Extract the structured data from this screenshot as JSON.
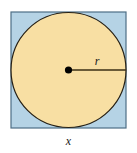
{
  "figure": {
    "kind": "geometry-diagram",
    "background_color": "#ffffff",
    "square": {
      "name": "outer-square",
      "fill_color": "#b5d3e5",
      "stroke_color": "#4e6f85",
      "stroke_width": 1.2,
      "x": 11,
      "y": 12,
      "width": 115,
      "height": 116,
      "side_label": "x"
    },
    "circle": {
      "name": "inscribed-circle",
      "fill_color": "#f8dfa3",
      "stroke_color": "#272014",
      "stroke_width": 1.2,
      "center_x": 68.5,
      "center_y": 70,
      "radius": 57.5,
      "radius_label": "r"
    },
    "center_point": {
      "name": "circle-center-dot",
      "color": "#000000",
      "radius": 3.6,
      "x": 68.5,
      "y": 70
    },
    "radius_segment": {
      "name": "radius-line",
      "color": "#3b2f14",
      "stroke_width": 1.3,
      "x1": 68.5,
      "y1": 70,
      "x2": 126,
      "y2": 70
    },
    "labels": {
      "radius": {
        "text": "r",
        "x": 97,
        "y": 65
      },
      "side": {
        "text": "x",
        "x": 68.5,
        "y": 145
      }
    }
  }
}
